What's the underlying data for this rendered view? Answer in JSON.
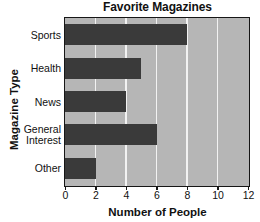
{
  "chart_data": {
    "type": "bar",
    "orientation": "horizontal",
    "title": "Favorite Magazines",
    "xlabel": "Number of People",
    "ylabel": "Magazine Type",
    "categories": [
      "Sports",
      "Health",
      "News",
      "General Interest",
      "Other"
    ],
    "category_lines": [
      [
        "Sports"
      ],
      [
        "Health"
      ],
      [
        "News"
      ],
      [
        "General",
        "Interest"
      ],
      [
        "Other"
      ]
    ],
    "values": [
      8,
      5,
      4,
      6,
      2
    ],
    "xlim": [
      0,
      12
    ],
    "xticks": [
      0,
      2,
      4,
      6,
      8,
      10,
      12
    ],
    "xtick_labels": [
      "0",
      "2",
      "4",
      "6",
      "8",
      "10",
      "12"
    ],
    "grid": "vertical",
    "legend": "none",
    "colors": {
      "bar": "#3a3a3a",
      "plot_background": "#b6b6b6",
      "gridline": "#f2f2f2",
      "axis": "#161616",
      "text": "#111111",
      "page_background": "#ffffff"
    }
  }
}
